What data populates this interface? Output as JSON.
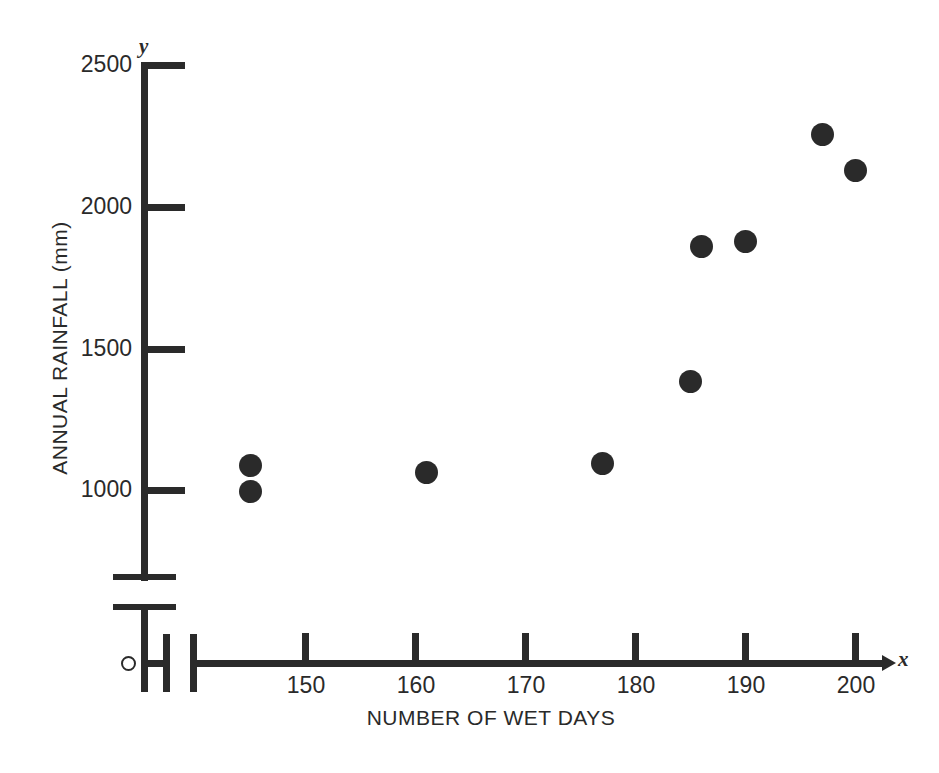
{
  "chart_data": {
    "type": "scatter",
    "title": "",
    "xlabel": "NUMBER OF WET DAYS",
    "ylabel": "ANNUAL RAINFALL (mm)",
    "x_axis_letter": "x",
    "y_axis_letter": "y",
    "origin_marker": "O",
    "xlim": [
      140,
      203
    ],
    "ylim": [
      850,
      2500
    ],
    "x_ticks": [
      150,
      160,
      170,
      180,
      190,
      200
    ],
    "x_tick_labels": [
      "150",
      "160",
      "170",
      "180",
      "190",
      "200"
    ],
    "y_ticks": [
      1000,
      1500,
      2000,
      2500
    ],
    "y_tick_labels": [
      "1000",
      "1500",
      "2000",
      "2500"
    ],
    "grid": false,
    "legend": false,
    "axis_break_x": true,
    "axis_break_y": true,
    "marker": "filled-circle",
    "marker_color": "#2a2a2a",
    "points": [
      {
        "x": 145,
        "y": 1090
      },
      {
        "x": 145,
        "y": 995
      },
      {
        "x": 161,
        "y": 1065
      },
      {
        "x": 177,
        "y": 1095
      },
      {
        "x": 185,
        "y": 1385
      },
      {
        "x": 186,
        "y": 1860
      },
      {
        "x": 190,
        "y": 1880
      },
      {
        "x": 197,
        "y": 2255
      },
      {
        "x": 200,
        "y": 2130
      }
    ]
  },
  "colors": {
    "ink": "#2a2a2a",
    "background": "#ffffff"
  }
}
